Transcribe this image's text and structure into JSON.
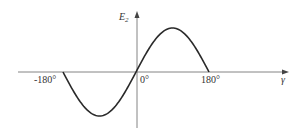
{
  "chart_data": {
    "type": "line",
    "title": "",
    "xlabel": "γ",
    "ylabel": "E2",
    "ylabel_main": "E",
    "ylabel_sub": "2",
    "x_ticks": [
      "-180°",
      "0°",
      "180°"
    ],
    "x": [
      -180,
      -135,
      -90,
      -45,
      0,
      45,
      90,
      135,
      180
    ],
    "values": [
      0,
      -0.71,
      -1,
      -0.71,
      0,
      0.71,
      1,
      0.71,
      0
    ],
    "xlim": [
      -180,
      180
    ],
    "grid": false,
    "legend": null
  },
  "colors": {
    "curve": "#2a2a2a",
    "axis": "#555555"
  }
}
